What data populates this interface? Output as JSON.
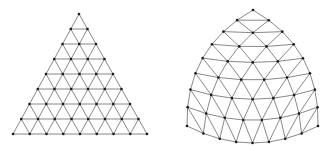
{
  "canvas": {
    "width": 330,
    "height": 151,
    "background": "#ffffff"
  },
  "style": {
    "edge_color": "#7a7a7a",
    "node_color": "#1a1a1a",
    "edge_width": 0.9,
    "node_radius": 1.3
  },
  "meshes": [
    {
      "name": "flat-triangle-mesh",
      "subdivisions": 8,
      "vertices": {
        "top": [
          79,
          14
        ],
        "bottom_left": [
          13,
          134
        ],
        "bottom_right": [
          147,
          134
        ]
      },
      "bulge": {
        "left": 0,
        "right": 0,
        "bottom": 0
      }
    },
    {
      "name": "curved-triangle-mesh",
      "subdivisions": 8,
      "vertices": {
        "top": [
          253,
          10
        ],
        "bottom_left": [
          187,
          126
        ],
        "bottom_right": [
          318,
          126
        ]
      },
      "bulge": {
        "left": 20,
        "right": 20,
        "bottom": 17
      }
    }
  ]
}
